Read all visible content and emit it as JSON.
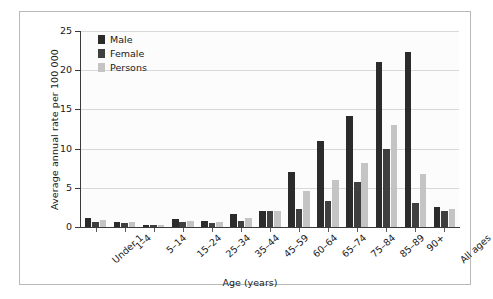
{
  "chart_data": {
    "type": "bar",
    "title": "",
    "xlabel": "Age (years)",
    "ylabel": "Average annual rate per 100 000",
    "ylim": [
      0,
      25
    ],
    "yticks": [
      0,
      5,
      10,
      15,
      20,
      25
    ],
    "grid": true,
    "legend_position": "top-left",
    "categories": [
      "Under 1",
      "1–4",
      "5–14",
      "15–24",
      "25–34",
      "35–44",
      "45–59",
      "60–64",
      "65–74",
      "75–84",
      "85–89",
      "90+",
      "All ages"
    ],
    "series": [
      {
        "name": "Male",
        "color": "#2b2b2b",
        "values": [
          1.1,
          0.7,
          0.3,
          1.0,
          0.8,
          1.6,
          2.1,
          7.0,
          11.0,
          14.2,
          21.1,
          22.3,
          2.6
        ]
      },
      {
        "name": "Female",
        "color": "#3f3f3f",
        "values": [
          0.6,
          0.5,
          0.2,
          0.6,
          0.5,
          0.8,
          2.0,
          2.3,
          3.3,
          5.8,
          10.0,
          3.0,
          2.0
        ]
      },
      {
        "name": "Persons",
        "color": "#c4c4c4",
        "values": [
          0.9,
          0.6,
          0.25,
          0.8,
          0.65,
          1.2,
          2.1,
          4.6,
          6.0,
          8.2,
          13.0,
          6.8,
          2.3
        ]
      }
    ]
  },
  "legend": {
    "items": [
      {
        "label": "Male"
      },
      {
        "label": "Female"
      },
      {
        "label": "Persons"
      }
    ]
  },
  "axes": {
    "y_label": "Average annual rate per 100 000",
    "x_label": "Age (years)"
  }
}
